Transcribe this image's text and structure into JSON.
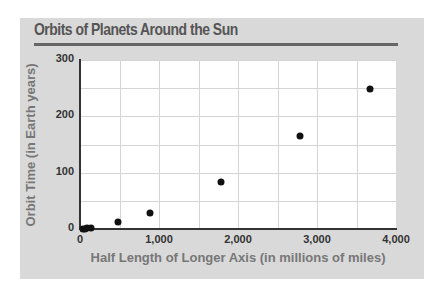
{
  "chart_data": {
    "type": "scatter",
    "title": "Orbits of Planets Around the Sun",
    "xlabel": "Half Length of Longer Axis (in millions of miles)",
    "ylabel": "Orbit Time (in Earth years)",
    "xlim": [
      0,
      4000
    ],
    "ylim": [
      0,
      300
    ],
    "x_ticks": [
      "0",
      "1,000",
      "2,000",
      "3,000",
      "4,000"
    ],
    "y_ticks": [
      "0",
      "100",
      "200",
      "300"
    ],
    "grid": true,
    "legend": null,
    "series": [
      {
        "name": "Planets",
        "points": [
          {
            "x": 36,
            "y": 0.24
          },
          {
            "x": 67,
            "y": 0.62
          },
          {
            "x": 93,
            "y": 1.0
          },
          {
            "x": 142,
            "y": 1.9
          },
          {
            "x": 484,
            "y": 12
          },
          {
            "x": 886,
            "y": 29
          },
          {
            "x": 1780,
            "y": 84
          },
          {
            "x": 2780,
            "y": 165
          },
          {
            "x": 3670,
            "y": 248
          }
        ]
      }
    ],
    "colors": {
      "panel_bg": "#d9d9d9",
      "plot_bg": "#ffffff",
      "point": "#111111",
      "title": "#555555",
      "axis_label": "#777777"
    }
  }
}
